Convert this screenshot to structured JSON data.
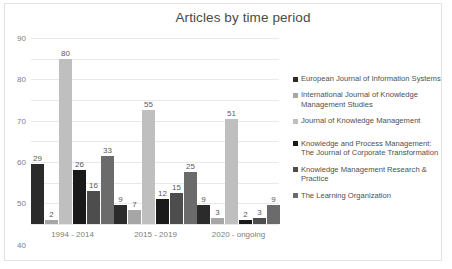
{
  "chart_data": {
    "type": "bar",
    "title": "Articles by time period",
    "xlabel": "",
    "ylabel": "",
    "ylim": [
      0,
      90
    ],
    "ytick_step": 10,
    "yticks": [
      "0",
      "10",
      "20",
      "30",
      "40",
      "50",
      "60",
      "70",
      "80",
      "90"
    ],
    "grid": true,
    "legend_position": "right",
    "categories": [
      "1994 - 2014",
      "2015 - 2019",
      "2020 - ongoing"
    ],
    "series": [
      {
        "name": "European Journal of Information Systems",
        "color": "#2b2b2b",
        "values": [
          29,
          9,
          9
        ]
      },
      {
        "name": "International Journal of Knowledge Management Studies",
        "color": "#a6a6a6",
        "values": [
          2,
          7,
          3
        ]
      },
      {
        "name": "Journal of Knowledge Management",
        "color": "#bfbfbf",
        "values": [
          80,
          55,
          51
        ]
      },
      {
        "name": "Knowledge and Process Management: The Journal of Corporate Transformation",
        "color": "#1a1a1a",
        "values": [
          26,
          12,
          2
        ]
      },
      {
        "name": "Knowledge Management Research & Practice",
        "color": "#4d4d4d",
        "values": [
          16,
          15,
          3
        ]
      },
      {
        "name": "The Learning Organization",
        "color": "#6b6b6b",
        "values": [
          33,
          25,
          9
        ]
      }
    ]
  }
}
